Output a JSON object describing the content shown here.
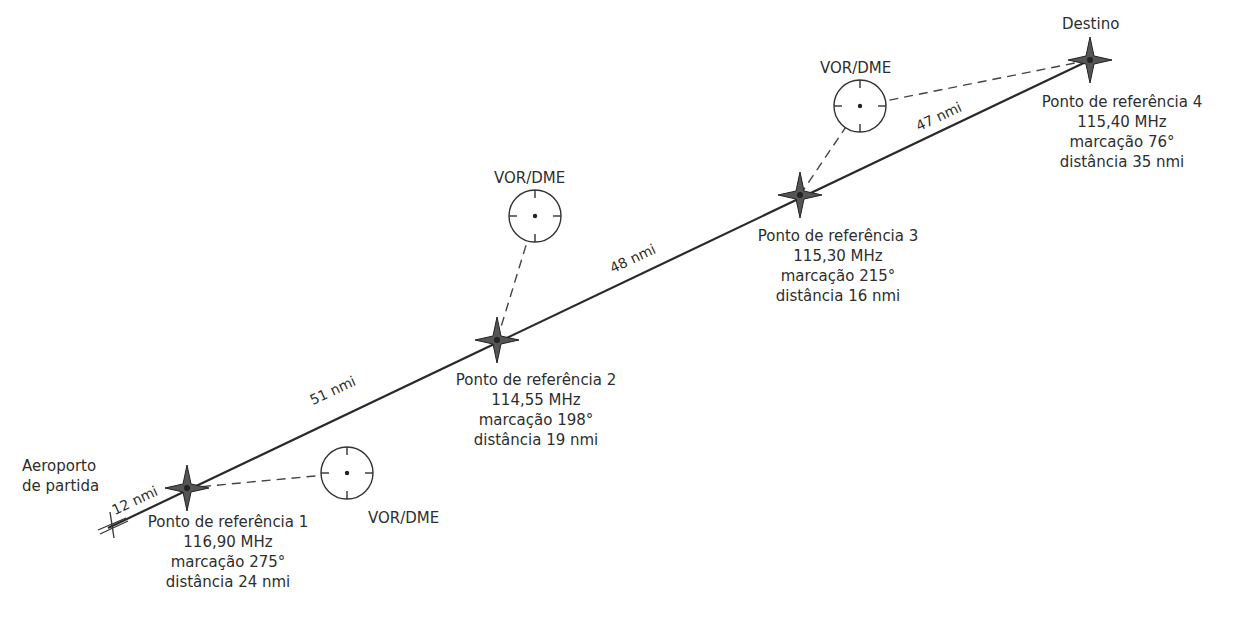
{
  "departure": {
    "label_line1": "Aeroporto",
    "label_line2": "de partida"
  },
  "destination": {
    "label": "Destino"
  },
  "segments": [
    {
      "label": "12 nmi"
    },
    {
      "label": "51 nmi"
    },
    {
      "label": "48 nmi"
    },
    {
      "label": "47 nmi"
    }
  ],
  "waypoints": [
    {
      "name": "Ponto de referência 1",
      "frequency": "116,90 MHz",
      "bearing": "marcação 275°",
      "distance": "distância 24 nmi"
    },
    {
      "name": "Ponto de referência 2",
      "frequency": "114,55 MHz",
      "bearing": "marcação 198°",
      "distance": "distância 19 nmi"
    },
    {
      "name": "Ponto de referência 3",
      "frequency": "115,30 MHz",
      "bearing": "marcação 215°",
      "distance": "distância 16 nmi"
    },
    {
      "name": "Ponto de referência 4",
      "frequency": "115,40 MHz",
      "bearing": "marcação 76°",
      "distance": "distância 35 nmi"
    }
  ],
  "stations": [
    {
      "label": "VOR/DME"
    },
    {
      "label": "VOR/DME"
    },
    {
      "label": "VOR/DME"
    }
  ],
  "colors": {
    "route": "#2a2a2a",
    "star": "#4a4a4a",
    "dashed": "#444444"
  }
}
